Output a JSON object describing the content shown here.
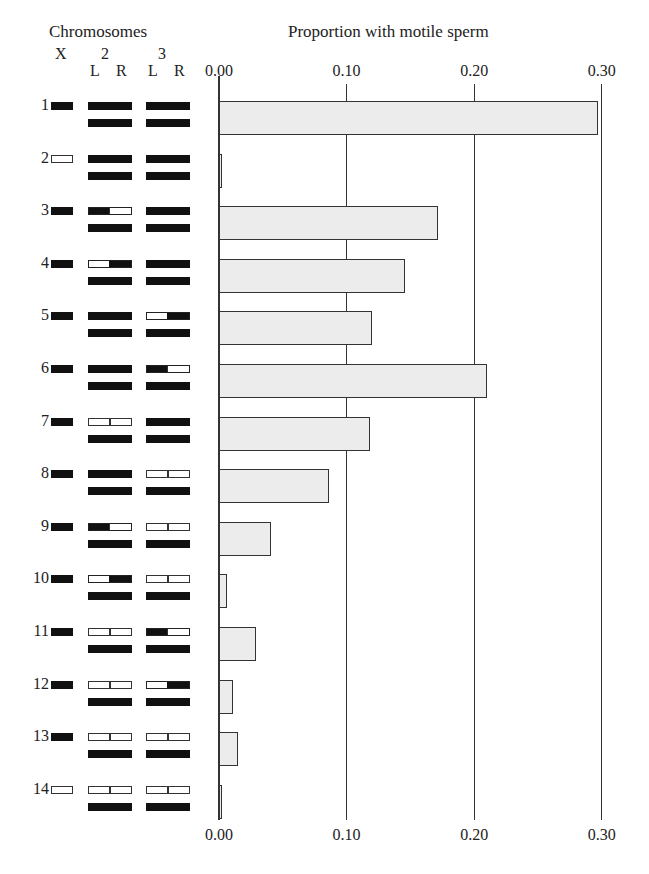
{
  "headers": {
    "left_title": "Chromosomes",
    "right_title": "Proportion with motile sperm",
    "chr_x": "X",
    "chr_2": "2",
    "chr_3": "3",
    "arm_2L": "L",
    "arm_2R": "R",
    "arm_3L": "L",
    "arm_3R": "R"
  },
  "axis": {
    "top_ticks": [
      "0.00",
      "0.10",
      "0.20",
      "0.30"
    ],
    "bottom_ticks": [
      "0.00",
      "0.10",
      "0.20",
      "0.30"
    ]
  },
  "genotypes": [
    {
      "row": "1",
      "X": "b",
      "c2": [
        "b",
        "b"
      ],
      "c3": [
        "b",
        "b"
      ]
    },
    {
      "row": "2",
      "X": "w",
      "c2": [
        "b",
        "b"
      ],
      "c3": [
        "b",
        "b"
      ]
    },
    {
      "row": "3",
      "X": "b",
      "c2": [
        "b",
        "w"
      ],
      "c3": [
        "b",
        "b"
      ]
    },
    {
      "row": "4",
      "X": "b",
      "c2": [
        "w",
        "b"
      ],
      "c3": [
        "b",
        "b"
      ]
    },
    {
      "row": "5",
      "X": "b",
      "c2": [
        "b",
        "b"
      ],
      "c3": [
        "w",
        "b"
      ]
    },
    {
      "row": "6",
      "X": "b",
      "c2": [
        "b",
        "b"
      ],
      "c3": [
        "b",
        "w"
      ]
    },
    {
      "row": "7",
      "X": "b",
      "c2": [
        "w",
        "w"
      ],
      "c3": [
        "b",
        "b"
      ]
    },
    {
      "row": "8",
      "X": "b",
      "c2": [
        "b",
        "b"
      ],
      "c3": [
        "w",
        "w"
      ]
    },
    {
      "row": "9",
      "X": "b",
      "c2": [
        "b",
        "w"
      ],
      "c3": [
        "w",
        "w"
      ]
    },
    {
      "row": "10",
      "X": "b",
      "c2": [
        "w",
        "b"
      ],
      "c3": [
        "w",
        "w"
      ]
    },
    {
      "row": "11",
      "X": "b",
      "c2": [
        "w",
        "w"
      ],
      "c3": [
        "b",
        "w"
      ]
    },
    {
      "row": "12",
      "X": "b",
      "c2": [
        "w",
        "w"
      ],
      "c3": [
        "w",
        "b"
      ]
    },
    {
      "row": "13",
      "X": "b",
      "c2": [
        "w",
        "w"
      ],
      "c3": [
        "w",
        "w"
      ]
    },
    {
      "row": "14",
      "X": "w",
      "c2": [
        "w",
        "w"
      ],
      "c3": [
        "w",
        "w"
      ]
    }
  ],
  "colors": {
    "bar_fill": "#ececec",
    "bar_border": "#333333",
    "chromosome_dark": "#111111",
    "chromosome_light": "#ffffff"
  },
  "chart_data": {
    "type": "bar",
    "orientation": "horizontal",
    "title": "Proportion with motile sperm",
    "xlabel": "Proportion with motile sperm",
    "ylabel": "Chromosomes (genotype)",
    "categories": [
      "1",
      "2",
      "3",
      "4",
      "5",
      "6",
      "7",
      "8",
      "9",
      "10",
      "11",
      "12",
      "13",
      "14"
    ],
    "values": [
      0.297,
      0.002,
      0.172,
      0.146,
      0.12,
      0.21,
      0.118,
      0.086,
      0.041,
      0.006,
      0.029,
      0.011,
      0.015,
      0.002
    ],
    "xlim": [
      0,
      0.3
    ],
    "xticks": [
      0.0,
      0.1,
      0.2,
      0.3
    ],
    "grid": true,
    "legend": "none",
    "annotations": "Left panel shows chromosome composition: X, 2 (L,R arms), 3 (L,R arms); black = one species origin, white = other; lower bars = second homolog (all black)."
  }
}
